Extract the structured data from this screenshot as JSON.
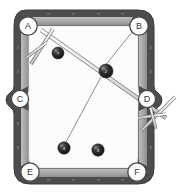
{
  "diagram": {
    "surface_color": "#fbfbfb",
    "frame_color": "#4a4a4a",
    "rail_color": "#9a9a9a",
    "cushion_color": "#b8b8b8",
    "ball_color": "#252525",
    "cue_color": "#e8e8e8",
    "line_color": "#8c8c8c"
  },
  "pockets": [
    {
      "id": "A",
      "label": "A",
      "kind": "corner",
      "position": "top-left",
      "cx": 28,
      "cy": 26
    },
    {
      "id": "B",
      "label": "B",
      "kind": "corner",
      "position": "top-right",
      "cx": 136,
      "cy": 26
    },
    {
      "id": "C",
      "label": "C",
      "kind": "side",
      "position": "left-middle",
      "cx": 20,
      "cy": 98
    },
    {
      "id": "D",
      "label": "D",
      "kind": "side",
      "position": "right-middle",
      "cx": 146,
      "cy": 98
    },
    {
      "id": "E",
      "label": "E",
      "kind": "corner",
      "position": "bottom-left",
      "cx": 30,
      "cy": 173
    },
    {
      "id": "F",
      "label": "F",
      "kind": "corner",
      "position": "bottom-right",
      "cx": 136,
      "cy": 173
    }
  ],
  "balls": [
    {
      "id": "ball-upper-left",
      "number": "7",
      "cx": 58,
      "cy": 53,
      "r": 6.0
    },
    {
      "id": "ball-center",
      "number": "2",
      "cx": 106,
      "cy": 71,
      "r": 7.0
    },
    {
      "id": "ball-lower-left",
      "number": "4",
      "cx": 64,
      "cy": 148,
      "r": 6.2
    },
    {
      "id": "ball-lower-right",
      "number": "3",
      "cx": 98,
      "cy": 150,
      "r": 6.2
    }
  ],
  "aim_lines": [
    {
      "id": "line-b-to-center",
      "from": "B",
      "to": "ball-center",
      "x1": 133,
      "y1": 31,
      "x2": 104,
      "y2": 67
    },
    {
      "id": "line-center-to-e",
      "from": "ball-center",
      "to": "ball-lower-left",
      "x1": 101,
      "y1": 76,
      "x2": 65,
      "y2": 143
    }
  ],
  "cues": [
    {
      "id": "cue-top-left",
      "description": "cue stick aimed from upper-left toward pocket D",
      "x1": 42,
      "y1": 31,
      "x2": 164,
      "y2": 116,
      "bridge": {
        "id": "bridge-top-left",
        "x1": 32,
        "y1": 63,
        "x2": 52,
        "y2": 30,
        "head_x1": 27,
        "head_y1": 57,
        "head_x2": 47,
        "head_y2": 42
      }
    },
    {
      "id": "cue-bottom-right",
      "description": "cue stick resting at pocket D rail",
      "x1": 143,
      "y1": 128,
      "x2": 173,
      "y2": 99,
      "bridge": {
        "id": "bridge-bottom-right",
        "x1": 140,
        "y1": 119,
        "x2": 163,
        "y2": 116,
        "head_x1": 150,
        "head_y1": 108,
        "head_x2": 155,
        "head_y2": 127
      }
    }
  ],
  "rail_markers": {
    "label": "diamond-sight-markers",
    "top": [
      48,
      73,
      98,
      123
    ],
    "bottom": [
      48,
      73,
      98,
      123
    ],
    "left": [
      48,
      73,
      123,
      148
    ],
    "right": [
      48,
      73,
      123,
      148
    ]
  }
}
